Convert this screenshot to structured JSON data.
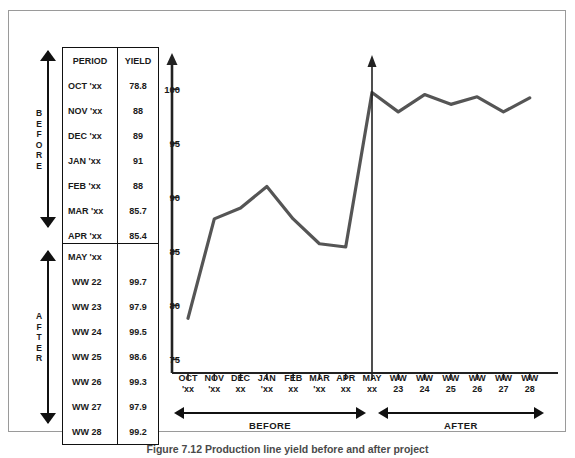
{
  "figure": {
    "caption": "Figure 7.12  Production line yield before and after project",
    "line_color": "#555555",
    "axis_color": "#222222"
  },
  "before_table": {
    "header": {
      "period": "PERIOD",
      "yield": "YIELD"
    },
    "bracket_label": "BEFORE",
    "rows": [
      {
        "period": "OCT 'xx",
        "yield": "78.8"
      },
      {
        "period": "NOV 'xx",
        "yield": "88"
      },
      {
        "period": "DEC 'xx",
        "yield": "89"
      },
      {
        "period": "JAN 'xx",
        "yield": "91"
      },
      {
        "period": "FEB 'xx",
        "yield": "88"
      },
      {
        "period": "MAR 'xx",
        "yield": "85.7"
      },
      {
        "period": "APR 'xx",
        "yield": "85.4"
      }
    ]
  },
  "after_table": {
    "bracket_label": "AFTER",
    "rows": [
      {
        "period": "MAY 'xx",
        "yield": ""
      },
      {
        "period": "WW 22",
        "yield": "99.7"
      },
      {
        "period": "WW 23",
        "yield": "97.9"
      },
      {
        "period": "WW 24",
        "yield": "99.5"
      },
      {
        "period": "WW 25",
        "yield": "98.6"
      },
      {
        "period": "WW 26",
        "yield": "99.3"
      },
      {
        "period": "WW 27",
        "yield": "97.9"
      },
      {
        "period": "WW 28",
        "yield": "99.2"
      }
    ]
  },
  "axis_brackets": {
    "before": "BEFORE",
    "after": "AFTER"
  },
  "chart_data": {
    "type": "line",
    "title": "",
    "xlabel": "",
    "ylabel": "",
    "ylim": [
      73,
      101.5
    ],
    "yticks": [
      75,
      80,
      85,
      90,
      95,
      100
    ],
    "grid": false,
    "legend": false,
    "categories": [
      "OCT 'xx",
      "NOV 'xx",
      "DEC xx",
      "JAN 'xx",
      "FEB xx",
      "MAR 'xx",
      "APR xx",
      "MAY xx",
      "WW 23",
      "WW 24",
      "WW 25",
      "WW 26",
      "WW 27",
      "WW 28"
    ],
    "tick_labels": [
      {
        "l1": "OCT",
        "l2": "'xx"
      },
      {
        "l1": "NOV",
        "l2": "'xx"
      },
      {
        "l1": "DEC",
        "l2": "xx"
      },
      {
        "l1": "JAN",
        "l2": "'xx"
      },
      {
        "l1": "FEB",
        "l2": "xx"
      },
      {
        "l1": "MAR",
        "l2": "'xx"
      },
      {
        "l1": "APR",
        "l2": "xx"
      },
      {
        "l1": "MAY",
        "l2": "xx"
      },
      {
        "l1": "WW",
        "l2": "23"
      },
      {
        "l1": "WW",
        "l2": "24"
      },
      {
        "l1": "WW",
        "l2": "25"
      },
      {
        "l1": "WW",
        "l2": "26"
      },
      {
        "l1": "WW",
        "l2": "27"
      },
      {
        "l1": "WW",
        "l2": "28"
      }
    ],
    "series": [
      {
        "name": "Yield",
        "values": [
          78.8,
          88,
          89,
          91,
          88,
          85.7,
          85.4,
          99.7,
          97.9,
          99.5,
          98.6,
          99.3,
          97.9,
          99.2
        ]
      }
    ],
    "annotations": [
      {
        "type": "vertical-arrow",
        "at_category": "MAY xx",
        "note": "improvement implemented"
      }
    ]
  }
}
